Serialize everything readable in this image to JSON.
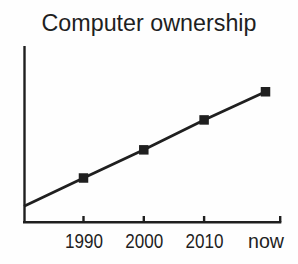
{
  "chart_data": {
    "type": "line",
    "title": "Computer ownership",
    "categories": [
      "1990",
      "2000",
      "2010",
      "now"
    ],
    "series": [
      {
        "name": "Computer ownership",
        "values": [
          0.25,
          0.41,
          0.58,
          0.74
        ]
      }
    ],
    "y_axis_intercept_value": 0.09,
    "xlabel": "",
    "ylabel": "",
    "ylim": [
      0,
      1
    ],
    "y_tick_labels": [],
    "grid": false,
    "legend": "none",
    "marker": "filled-square",
    "trend": "steady linear increase from before 1990 to now",
    "ink_color": "#1f1f1f",
    "background_color": "#fefefe"
  }
}
